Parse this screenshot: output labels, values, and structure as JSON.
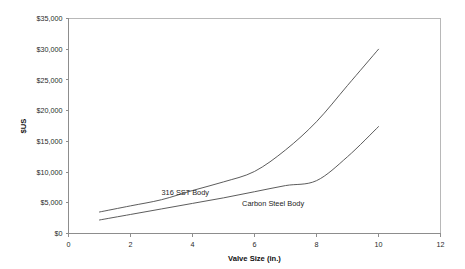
{
  "chart_data": {
    "type": "line",
    "title": "",
    "subtitle": "",
    "xlabel": "Valve Size (in.)",
    "ylabel": "$US",
    "xlim": [
      0,
      12
    ],
    "ylim": [
      0,
      35000
    ],
    "grid": false,
    "legend_position": "inline-annotations",
    "x_ticks": [
      0,
      2,
      4,
      6,
      8,
      10,
      12
    ],
    "x_tick_labels": [
      "0",
      "2",
      "4",
      "6",
      "8",
      "10",
      "12"
    ],
    "y_ticks": [
      0,
      5000,
      10000,
      15000,
      20000,
      25000,
      30000,
      35000
    ],
    "y_tick_labels": [
      "$0",
      "$5,000",
      "$10,000",
      "$15,000",
      "$20,000",
      "$25,000",
      "$30,000",
      "$35,000"
    ],
    "series": [
      {
        "name": "316 SST Body",
        "label_position": {
          "x": 3.0,
          "y": 6300
        },
        "color": "#4a4a4a",
        "x": [
          1,
          2,
          3,
          4,
          5,
          6,
          7,
          8,
          9,
          10
        ],
        "values": [
          3500,
          4500,
          5500,
          7000,
          8400,
          10100,
          13600,
          18200,
          24100,
          30000
        ]
      },
      {
        "name": "Carbon Steel Body",
        "label_position": {
          "x": 5.6,
          "y": 4550
        },
        "color": "#4a4a4a",
        "x": [
          1,
          2,
          3,
          4,
          5,
          6,
          7,
          8,
          9,
          10
        ],
        "values": [
          2200,
          3100,
          4000,
          4900,
          5800,
          6800,
          7800,
          8600,
          12500,
          17400
        ]
      }
    ]
  }
}
